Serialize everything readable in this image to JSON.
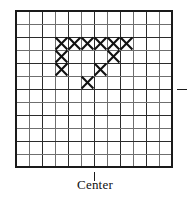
{
  "figure": {
    "title": "",
    "center_label": "Center",
    "colors": {
      "background": "#ffffff",
      "grid_major": "#2b2b2b",
      "grid_minor": "#6f6f6f",
      "border": "#1a1a1a",
      "stitch": "#111111"
    }
  },
  "chart_data": {
    "type": "heatmap",
    "title": "",
    "subtitle": "",
    "xlabel": "",
    "ylabel": "",
    "grid": {
      "columns": 12,
      "rows": 12,
      "cell_size_px": 13,
      "origin_x_px": 16,
      "origin_y_px": 11
    },
    "categories": [
      "1",
      "2",
      "3",
      "4",
      "5",
      "6",
      "7",
      "8",
      "9",
      "10",
      "11",
      "12"
    ],
    "row_labels": [
      "1",
      "2",
      "3",
      "4",
      "5",
      "6",
      "7",
      "8",
      "9",
      "10",
      "11",
      "12"
    ],
    "legend": [
      {
        "symbol": "X",
        "label": "stitch",
        "color": "#111111"
      }
    ],
    "stitches": [
      {
        "col": 4,
        "row": 3
      },
      {
        "col": 5,
        "row": 3
      },
      {
        "col": 6,
        "row": 3
      },
      {
        "col": 7,
        "row": 3
      },
      {
        "col": 8,
        "row": 3
      },
      {
        "col": 9,
        "row": 3
      },
      {
        "col": 4,
        "row": 4
      },
      {
        "col": 8,
        "row": 4
      },
      {
        "col": 4,
        "row": 5
      },
      {
        "col": 7,
        "row": 5
      },
      {
        "col": 6,
        "row": 6
      }
    ],
    "matrix": [
      [
        0,
        0,
        0,
        0,
        0,
        0,
        0,
        0,
        0,
        0,
        0,
        0
      ],
      [
        0,
        0,
        0,
        0,
        0,
        0,
        0,
        0,
        0,
        0,
        0,
        0
      ],
      [
        0,
        0,
        0,
        1,
        1,
        1,
        1,
        1,
        1,
        0,
        0,
        0
      ],
      [
        0,
        0,
        0,
        1,
        0,
        0,
        0,
        1,
        0,
        0,
        0,
        0
      ],
      [
        0,
        0,
        0,
        1,
        0,
        0,
        1,
        0,
        0,
        0,
        0,
        0
      ],
      [
        0,
        0,
        0,
        0,
        0,
        1,
        0,
        0,
        0,
        0,
        0,
        0
      ],
      [
        0,
        0,
        0,
        0,
        0,
        0,
        0,
        0,
        0,
        0,
        0,
        0
      ],
      [
        0,
        0,
        0,
        0,
        0,
        0,
        0,
        0,
        0,
        0,
        0,
        0
      ],
      [
        0,
        0,
        0,
        0,
        0,
        0,
        0,
        0,
        0,
        0,
        0,
        0
      ],
      [
        0,
        0,
        0,
        0,
        0,
        0,
        0,
        0,
        0,
        0,
        0,
        0
      ],
      [
        0,
        0,
        0,
        0,
        0,
        0,
        0,
        0,
        0,
        0,
        0,
        0
      ],
      [
        0,
        0,
        0,
        0,
        0,
        0,
        0,
        0,
        0,
        0,
        0,
        0
      ]
    ],
    "stitch_count": 11,
    "markers": [
      {
        "name": "center-tick-bottom",
        "orientation": "vertical",
        "edge": "bottom",
        "at_column_boundary": 6,
        "label": "Center"
      },
      {
        "name": "center-tick-right",
        "orientation": "horizontal",
        "edge": "right",
        "at_row_boundary": 6,
        "label": ""
      }
    ],
    "grid_on": true,
    "legend_position": "none"
  }
}
